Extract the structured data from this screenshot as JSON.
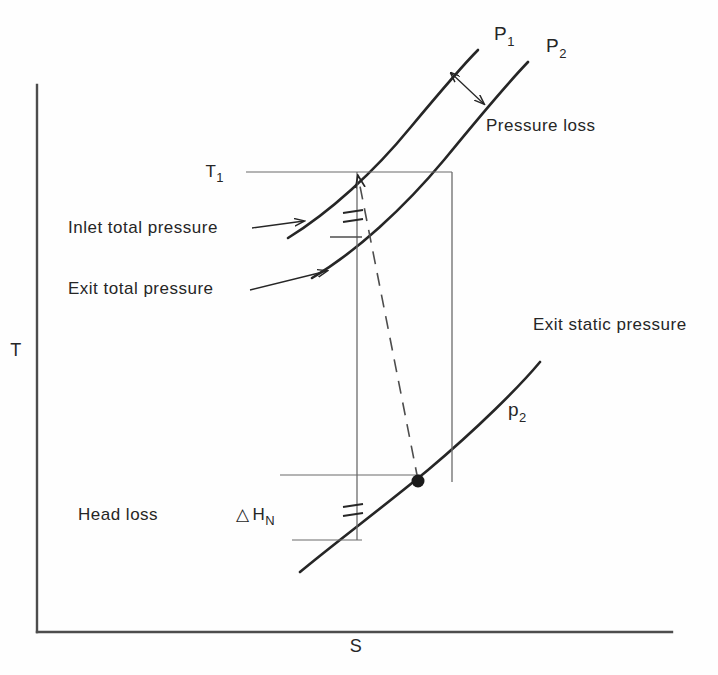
{
  "figure": {
    "type": "thermodynamic-ts-diagram",
    "background_color": "#fefefe",
    "line_color": "#262626",
    "thin_line_color": "#6b6b6b"
  },
  "axes": {
    "y_label": "T",
    "x_label": "S",
    "y_axis": {
      "x": 37,
      "y_top": 85,
      "y_bottom": 632
    },
    "x_axis": {
      "y": 632,
      "x_left": 37,
      "x_right": 672
    },
    "y_label_pos": {
      "x": 16,
      "y": 356
    },
    "x_label_pos": {
      "x": 356,
      "y": 652
    }
  },
  "curves": [
    {
      "name": "inlet-total-pressure-curve",
      "label": "P",
      "label_sub": "1",
      "label_pos": {
        "x": 494,
        "y": 40
      },
      "path": "M 288 238 C 330 212 374 172 410 128 C 440 92 460 68 478 50"
    },
    {
      "name": "exit-total-pressure-curve",
      "label": "P",
      "label_sub": "2",
      "label_pos": {
        "x": 546,
        "y": 52
      },
      "path": "M 312 278 C 356 252 404 208 444 160 C 480 116 505 86 528 62"
    },
    {
      "name": "exit-static-pressure-curve",
      "label": "p",
      "label_sub": "2",
      "label_pos": {
        "x": 508,
        "y": 416
      },
      "path": "M 300 572 C 336 542 382 508 428 470 C 478 428 520 386 540 362"
    }
  ],
  "annotations": [
    {
      "name": "pressure-loss-label",
      "text": "Pressure  loss",
      "pos": {
        "x": 486,
        "y": 131
      }
    },
    {
      "name": "inlet-total-pressure-label",
      "text": "Inlet  total  pressure",
      "pos": {
        "x": 68,
        "y": 233
      }
    },
    {
      "name": "exit-total-pressure-label",
      "text": "Exit  total  pressure",
      "pos": {
        "x": 68,
        "y": 294
      }
    },
    {
      "name": "exit-static-pressure-label",
      "text": "Exit  static  pressure",
      "pos": {
        "x": 533,
        "y": 330
      }
    },
    {
      "name": "head-loss-label",
      "text": "Head  loss",
      "pos": {
        "x": 78,
        "y": 520
      }
    }
  ],
  "symbols": {
    "t1": {
      "letter": "T",
      "sub": "1",
      "pos": {
        "x": 224,
        "y": 176
      }
    },
    "delta_h": {
      "delta": "△",
      "letter": "H",
      "sub": "N",
      "pos": {
        "x": 236,
        "y": 520
      }
    }
  },
  "leaders": [
    {
      "name": "inlet-pressure-leader",
      "x1": 252,
      "y1": 228,
      "x2": 304,
      "y2": 222
    },
    {
      "name": "exit-pressure-leader",
      "x1": 250,
      "y1": 289,
      "x2": 326,
      "y2": 272
    },
    {
      "name": "t1-reference-line",
      "x1": 246,
      "y1": 172,
      "x2": 452,
      "y2": 172
    }
  ],
  "pressure_loss_arrow": {
    "x1": 451,
    "y1": 73,
    "x2": 484,
    "y2": 104
  },
  "process_lines": {
    "vertical_left": {
      "x": 357,
      "y_top": 172,
      "y_bottom": 540
    },
    "vertical_right": {
      "x": 452,
      "y_top": 172,
      "y_bottom": 482
    },
    "dashed": {
      "x1": 358,
      "y1": 174,
      "x2": 418,
      "y2": 480
    }
  },
  "tick_marks": [
    {
      "name": "upper-tick",
      "x1": 330,
      "y": 237,
      "x2": 362
    },
    {
      "name": "head-loss-upper-line",
      "x1": 280,
      "y": 475,
      "x2": 420
    },
    {
      "name": "head-loss-lower-line",
      "x1": 292,
      "y": 540,
      "x2": 362
    }
  ],
  "break_marks": [
    {
      "name": "upper-break-mark",
      "x": 352,
      "y": 216
    },
    {
      "name": "lower-break-mark",
      "x": 352,
      "y": 510
    }
  ],
  "state_point": {
    "name": "exit-state-point",
    "x": 418,
    "y": 481,
    "r": 6.5
  }
}
